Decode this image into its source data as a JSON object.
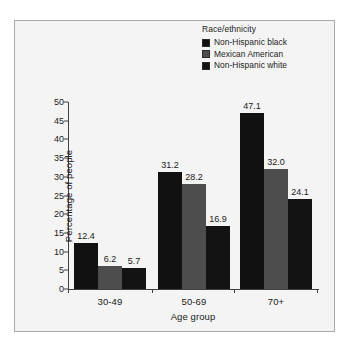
{
  "chart_data": {
    "type": "bar",
    "title": "",
    "xlabel": "Age group",
    "ylabel": "Percentage of people",
    "categories": [
      "30-49",
      "50-69",
      "70+"
    ],
    "series": [
      {
        "name": "Non-Hispanic black",
        "color": "#111111",
        "values": [
          12.4,
          31.2,
          47.1
        ],
        "labels": [
          "12.4",
          "31.2",
          "47.1"
        ]
      },
      {
        "name": "Mexican American",
        "color": "#4d4d4d",
        "values": [
          6.2,
          28.2,
          32.0
        ],
        "labels": [
          "6.2",
          "28.2",
          "32.0"
        ]
      },
      {
        "name": "Non-Hispanic white",
        "color": "#131313",
        "values": [
          5.7,
          16.9,
          24.1
        ],
        "labels": [
          "5.7",
          "16.9",
          "24.1"
        ]
      }
    ],
    "ylim": [
      0,
      50
    ],
    "yticks": [
      "0",
      "5",
      "10",
      "15",
      "20",
      "25",
      "30",
      "35",
      "40",
      "45",
      "50"
    ],
    "ytick_values": [
      0,
      5,
      10,
      15,
      20,
      25,
      30,
      35,
      40,
      45,
      50
    ],
    "grid": false,
    "legend_position": "top-right",
    "legend_title": "Race/ethnicity"
  },
  "legend": {
    "title": "Race/ethnicity",
    "entries": [
      {
        "label": "Non-Hispanic black",
        "color": "#111111"
      },
      {
        "label": "Mexican American",
        "color": "#4d4d4d"
      },
      {
        "label": "Non-Hispanic white",
        "color": "#131313"
      }
    ]
  },
  "axes": {
    "y_title": "Percentage of people",
    "x_title": "Age group"
  }
}
